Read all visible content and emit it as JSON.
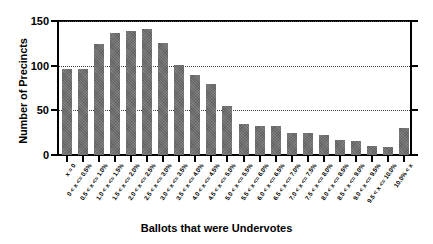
{
  "chart_data": {
    "type": "bar",
    "title": "",
    "xlabel": "Ballots that were Undervotes",
    "ylabel": "Number of Precincts",
    "ylim": [
      0,
      150
    ],
    "yticks": [
      0,
      50,
      100,
      150
    ],
    "grid": true,
    "legend": null,
    "categories": [
      "x = 0",
      "0 < x <= 0.5%",
      "0.5 < x <= 1.0%",
      "1.0 < x <= 1.5%",
      "1.5 < x <= 2.0%",
      "2.0 < x <= 2.5%",
      "2.5 < x <= 3.0%",
      "3.0 < x <= 3.5%",
      "3.5 < x <= 4.0%",
      "4.0 < x <= 4.5%",
      "4.5 < x <= 5.0%",
      "5.0 < x <= 5.5%",
      "5.5 < x <= 6.0%",
      "6.0 < x <= 6.5%",
      "6.5 < x <= 7.0%",
      "7.0 < x <= 7.5%",
      "7.5 < x <= 8.0%",
      "8.0 < x <= 8.5%",
      "8.5 < x <= 9.0%",
      "9.0 < x <= 9.5%",
      "9.5 < x <= 10.0%",
      "10.0% < x"
    ],
    "values": [
      96,
      96,
      124,
      137,
      139,
      141,
      125,
      101,
      90,
      79,
      55,
      35,
      33,
      32,
      25,
      25,
      22,
      17,
      16,
      10,
      9,
      30
    ],
    "bar_color": "#6e6e6e"
  }
}
